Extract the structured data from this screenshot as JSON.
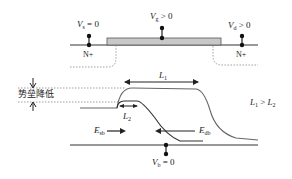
{
  "diagram": {
    "title": "",
    "terminals": {
      "source": {
        "symbol": "V",
        "sub": "s",
        "rel": "= 0"
      },
      "gate": {
        "symbol": "V",
        "sub": "g",
        "rel": "> 0"
      },
      "drain": {
        "symbol": "V",
        "sub": "d",
        "rel": "> 0"
      },
      "body": {
        "symbol": "V",
        "sub": "b",
        "rel": "= 0"
      }
    },
    "regions": {
      "source_region": "N+",
      "drain_region": "N+"
    },
    "barrier_label": "势垒降低",
    "lengths": {
      "L1": {
        "symbol": "L",
        "sub": "1"
      },
      "L2": {
        "symbol": "L",
        "sub": "2"
      },
      "relation": {
        "a": "L",
        "a_sub": "1",
        "op": " > ",
        "b": "L",
        "b_sub": "2"
      }
    },
    "fields": {
      "Esb": {
        "symbol": "E",
        "sub": "sb"
      },
      "Edb": {
        "symbol": "E",
        "sub": "db"
      }
    },
    "colors": {
      "gate_fill": "#c8c8c8",
      "line": "#333333",
      "curve_long": "#555555",
      "curve_short": "#333333",
      "dotted": "#777777"
    }
  }
}
